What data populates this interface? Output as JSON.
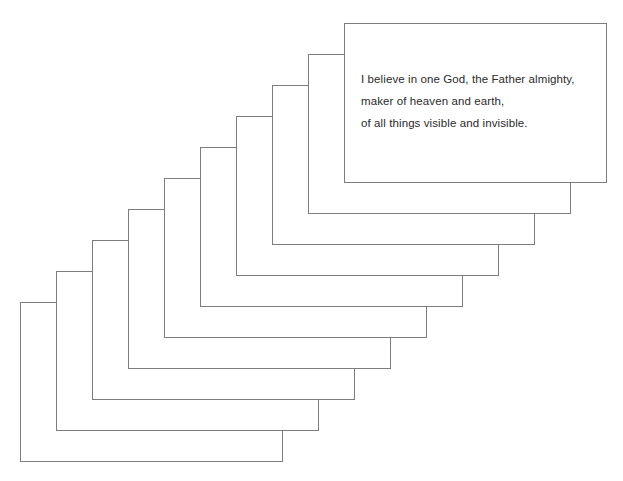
{
  "canvas": {
    "width": 623,
    "height": 481,
    "background_color": "#ffffff"
  },
  "stack": {
    "name": "cascading-card-stack",
    "card_count": 10,
    "card_width": 263,
    "card_height": 160,
    "step_x": 36,
    "step_y": -31,
    "back_card_left": 20,
    "back_card_top": 302,
    "front_card_left": 345,
    "front_card_top": 20,
    "border_color": "#7d7d7d",
    "border_width": 1,
    "fill_color": "#ffffff",
    "cards": [
      {
        "index": 0,
        "label": "card-10-back"
      },
      {
        "index": 1,
        "label": "card-9"
      },
      {
        "index": 2,
        "label": "card-8"
      },
      {
        "index": 3,
        "label": "card-7"
      },
      {
        "index": 4,
        "label": "card-6"
      },
      {
        "index": 5,
        "label": "card-5"
      },
      {
        "index": 6,
        "label": "card-4"
      },
      {
        "index": 7,
        "label": "card-3"
      },
      {
        "index": 8,
        "label": "card-2"
      },
      {
        "index": 9,
        "label": "card-1-front"
      }
    ]
  },
  "front_card": {
    "text_color": "#2b2b2b",
    "lines": [
      "I believe in one God, the Father almighty,",
      "maker of heaven and earth,",
      "of all things visible and invisible."
    ],
    "line_1": "I believe in one God, the Father almighty,",
    "line_2": "maker of heaven and earth,",
    "line_3": "of all things visible and invisible."
  }
}
